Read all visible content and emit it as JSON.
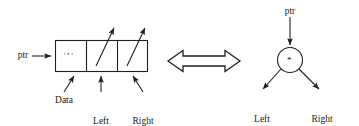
{
  "figure": {
    "stroke_color": "#231f20",
    "background_color": "#ffffff"
  },
  "left_diagram": {
    "pointer_label": "ptr",
    "cells": [
      {
        "name": "data",
        "value": "'*'",
        "caption": "Data"
      },
      {
        "name": "left-child",
        "value": "",
        "caption_line1": "Left",
        "caption_line2": "child"
      },
      {
        "name": "right-child",
        "value": "",
        "caption_line1": "Right",
        "caption_line2": "child"
      }
    ]
  },
  "equivalence": {
    "symbol_name": "double-headed-arrow"
  },
  "right_diagram": {
    "pointer_label": "ptr",
    "node_value": "*",
    "left_child": {
      "line1": "Left",
      "line2": "child"
    },
    "right_child": {
      "line1": "Right",
      "line2": "child"
    }
  }
}
